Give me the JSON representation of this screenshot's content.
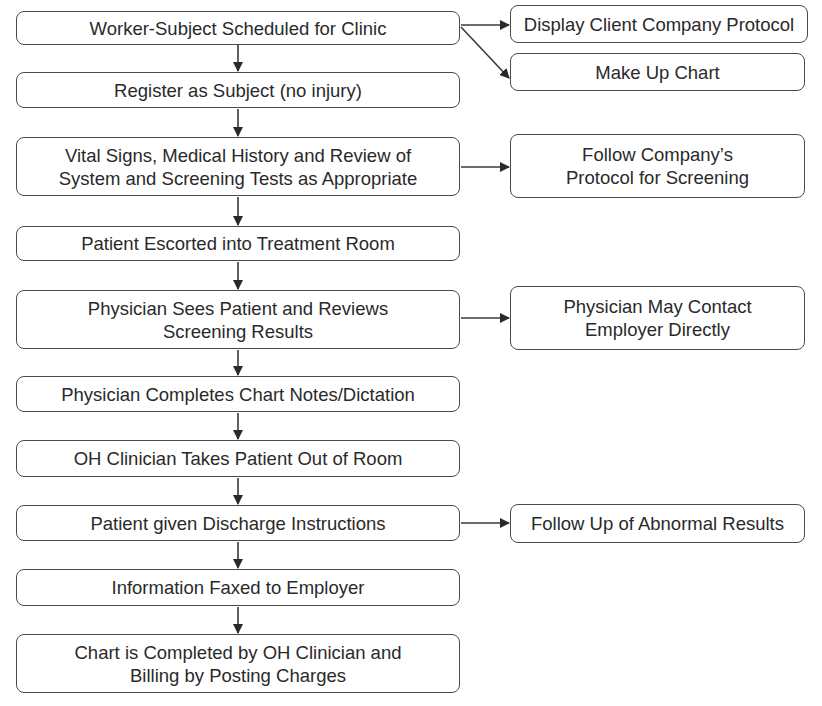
{
  "diagram": {
    "type": "flowchart",
    "colors": {
      "stroke": "#4a4a4a",
      "text": "#2a2a2a",
      "background": "#ffffff"
    },
    "main_steps": [
      {
        "id": "m1",
        "label": "Worker-Subject Scheduled for Clinic",
        "box": [
          16,
          11,
          444,
          34
        ]
      },
      {
        "id": "m2",
        "label": "Register as Subject (no injury)",
        "box": [
          16,
          72,
          444,
          36
        ]
      },
      {
        "id": "m3",
        "label": "Vital Signs, Medical History and Review of\nSystem and Screening Tests as Appropriate",
        "box": [
          16,
          137,
          444,
          59
        ]
      },
      {
        "id": "m4",
        "label": "Patient Escorted into Treatment Room",
        "box": [
          16,
          226,
          444,
          35
        ]
      },
      {
        "id": "m5",
        "label": "Physician Sees Patient and Reviews\nScreening Results",
        "box": [
          16,
          290,
          444,
          59
        ]
      },
      {
        "id": "m6",
        "label": "Physician Completes Chart Notes/Dictation",
        "box": [
          16,
          376,
          444,
          36
        ]
      },
      {
        "id": "m7",
        "label": "OH Clinician Takes Patient Out of Room",
        "box": [
          16,
          440,
          444,
          37
        ]
      },
      {
        "id": "m8",
        "label": "Patient given Discharge Instructions",
        "box": [
          16,
          505,
          444,
          36
        ]
      },
      {
        "id": "m9",
        "label": "Information Faxed to Employer",
        "box": [
          16,
          569,
          444,
          37
        ]
      },
      {
        "id": "m10",
        "label": "Chart is Completed by OH Clinician and\nBilling by Posting Charges",
        "box": [
          16,
          634,
          444,
          59
        ]
      }
    ],
    "side_steps": [
      {
        "id": "s1",
        "label": "Display Client Company Protocol",
        "box": [
          510,
          5,
          298,
          38
        ],
        "from": "m1"
      },
      {
        "id": "s2",
        "label": "Make Up Chart",
        "box": [
          510,
          53,
          295,
          38
        ],
        "from": "m1"
      },
      {
        "id": "s3",
        "label": "Follow Company’s\nProtocol for Screening",
        "box": [
          510,
          134,
          295,
          64
        ],
        "from": "m3"
      },
      {
        "id": "s4",
        "label": "Physician May Contact\nEmployer Directly",
        "box": [
          510,
          286,
          295,
          64
        ],
        "from": "m5"
      },
      {
        "id": "s5",
        "label": "Follow Up of Abnormal Results",
        "box": [
          510,
          504,
          295,
          39
        ],
        "from": "m8"
      }
    ],
    "edges": [
      {
        "from": "m1",
        "to": "m2"
      },
      {
        "from": "m2",
        "to": "m3"
      },
      {
        "from": "m3",
        "to": "m4"
      },
      {
        "from": "m4",
        "to": "m5"
      },
      {
        "from": "m5",
        "to": "m6"
      },
      {
        "from": "m6",
        "to": "m7"
      },
      {
        "from": "m7",
        "to": "m8"
      },
      {
        "from": "m8",
        "to": "m9"
      },
      {
        "from": "m9",
        "to": "m10"
      },
      {
        "from": "m1",
        "to": "s1"
      },
      {
        "from": "m1",
        "to": "s2"
      },
      {
        "from": "m3",
        "to": "s3"
      },
      {
        "from": "m5",
        "to": "s4"
      },
      {
        "from": "m8",
        "to": "s5"
      }
    ]
  }
}
